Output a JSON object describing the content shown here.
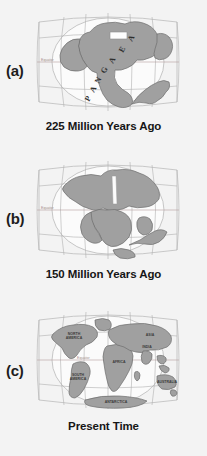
{
  "figure": {
    "background_color": "#f3f3f3",
    "land_color": "#a0a0a0",
    "ocean_color": "#fbfbfb",
    "grid_color": "#b0b0b0",
    "equator_label": "Equator"
  },
  "panels": [
    {
      "id": "a",
      "label": "(a)",
      "caption": "225 Million Years Ago",
      "supercontinent": "PANGAEA",
      "supercontinent_letters": [
        "P",
        "A",
        "N",
        "G",
        "A",
        "E",
        "A"
      ],
      "equator_label": "Equator",
      "continent_labels": []
    },
    {
      "id": "b",
      "label": "(b)",
      "caption": "150 Million Years Ago",
      "supercontinent": "",
      "supercontinent_letters": [],
      "equator_label": "Equator",
      "continent_labels": []
    },
    {
      "id": "c",
      "label": "(c)",
      "caption": "Present Time",
      "supercontinent": "",
      "supercontinent_letters": [],
      "equator_label": "Equator",
      "continent_labels": [
        "NORTH AMERICA",
        "SOUTH AMERICA",
        "AFRICA",
        "ASIA",
        "INDIA",
        "AUSTRALIA",
        "ANTARCTICA"
      ]
    }
  ]
}
